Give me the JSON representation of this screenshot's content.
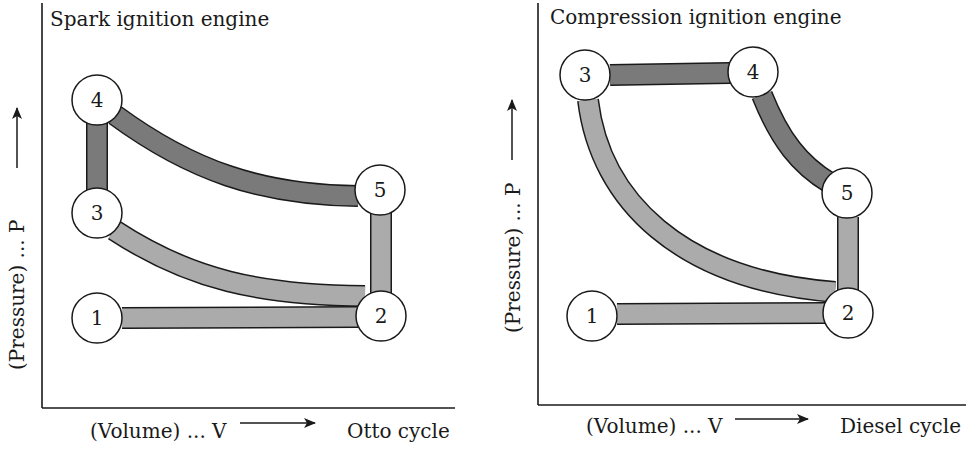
{
  "left_panel": {
    "title": "Spark ignition engine",
    "y_axis_label": "(Pressure) ... P",
    "x_axis_label": "(Volume) ... V",
    "cycle_label": "Otto cycle",
    "nodes": [
      {
        "id": "1",
        "label": "1"
      },
      {
        "id": "2",
        "label": "2"
      },
      {
        "id": "3",
        "label": "3"
      },
      {
        "id": "4",
        "label": "4"
      },
      {
        "id": "5",
        "label": "5"
      }
    ],
    "paths": [
      {
        "from": "1",
        "to": "2",
        "shade": "light",
        "shape": "horizontal"
      },
      {
        "from": "2",
        "to": "3",
        "shade": "light",
        "shape": "curve"
      },
      {
        "from": "3",
        "to": "4",
        "shade": "dark",
        "shape": "vertical"
      },
      {
        "from": "4",
        "to": "5",
        "shade": "dark",
        "shape": "curve"
      },
      {
        "from": "5",
        "to": "2",
        "shade": "light",
        "shape": "vertical"
      }
    ]
  },
  "right_panel": {
    "title": "Compression ignition engine",
    "y_axis_label": "(Pressure) ... P",
    "x_axis_label": "(Volume) ... V",
    "cycle_label": "Diesel cycle",
    "nodes": [
      {
        "id": "1",
        "label": "1"
      },
      {
        "id": "2",
        "label": "2"
      },
      {
        "id": "3",
        "label": "3"
      },
      {
        "id": "4",
        "label": "4"
      },
      {
        "id": "5",
        "label": "5"
      }
    ],
    "paths": [
      {
        "from": "1",
        "to": "2",
        "shade": "light",
        "shape": "horizontal"
      },
      {
        "from": "2",
        "to": "3",
        "shade": "light",
        "shape": "curve"
      },
      {
        "from": "3",
        "to": "4",
        "shade": "dark",
        "shape": "horizontal"
      },
      {
        "from": "4",
        "to": "5",
        "shade": "dark",
        "shape": "curve"
      },
      {
        "from": "5",
        "to": "2",
        "shade": "light",
        "shape": "vertical"
      }
    ]
  },
  "colors": {
    "dark_band": "#7a7a7a",
    "light_band": "#ababab",
    "ink": "#1a1a1a",
    "background": "#ffffff"
  }
}
